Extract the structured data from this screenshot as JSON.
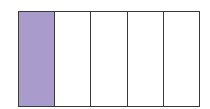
{
  "fraction_model": {
    "total_parts": 5,
    "shaded_parts": 1,
    "shaded_color": "#a99bcb",
    "unshaded_color": "#ffffff",
    "border_color": "#3a3a3a",
    "parts": [
      {
        "index": 0,
        "shaded": true
      },
      {
        "index": 1,
        "shaded": false
      },
      {
        "index": 2,
        "shaded": false
      },
      {
        "index": 3,
        "shaded": false
      },
      {
        "index": 4,
        "shaded": false
      }
    ]
  }
}
